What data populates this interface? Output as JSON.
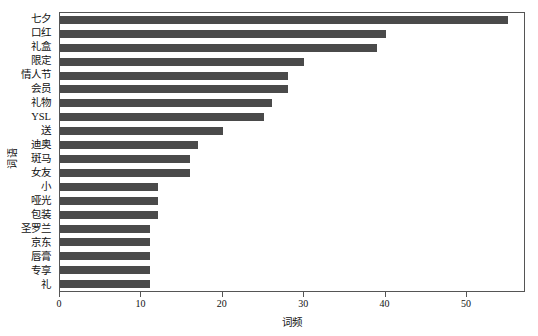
{
  "chart_data": {
    "type": "bar",
    "orientation": "horizontal",
    "title": "",
    "xlabel": "词频",
    "ylabel": "词语",
    "categories": [
      "七夕",
      "口红",
      "礼盒",
      "限定",
      "情人节",
      "会员",
      "礼物",
      "YSL",
      "送",
      "迪奥",
      "斑马",
      "女友",
      "小",
      "哑光",
      "包装",
      "圣罗兰",
      "京东",
      "唇膏",
      "专享",
      "礼"
    ],
    "values": [
      55,
      40,
      39,
      30,
      28,
      28,
      26,
      25,
      20,
      17,
      16,
      16,
      12,
      12,
      12,
      11,
      11,
      11,
      11,
      11
    ],
    "xlim": [
      0,
      57
    ],
    "xticks": [
      0,
      10,
      20,
      30,
      40,
      50
    ],
    "xticklabels": [
      "0",
      "10",
      "20",
      "30",
      "40",
      "50"
    ],
    "grid": false,
    "legend": false,
    "bar_color": "#4a4a4a",
    "frame_color": "#555555",
    "background": "#ffffff"
  }
}
